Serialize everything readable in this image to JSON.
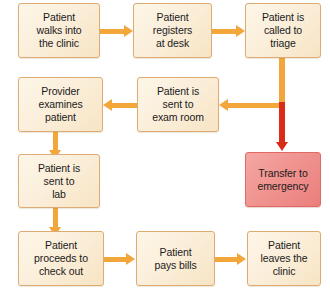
{
  "diagram": {
    "colors": {
      "process_fill": "#fbefdb",
      "process_border": "#ddab73",
      "alert_fill": "#f09490",
      "alert_border": "#e06a63",
      "arrow": "#f3a63a",
      "alert_arrow": "#d92b18",
      "text": "#1b1b1b",
      "background": "#ffffff"
    },
    "nodes": [
      {
        "id": "walks-in",
        "label": "Patient\nwalks into\nthe clinic",
        "line1": "Patient",
        "line2": "walks into",
        "line3": "the clinic",
        "type": "process"
      },
      {
        "id": "registers",
        "label": "Patient\nregisters\nat desk",
        "line1": "Patient",
        "line2": "registers",
        "line3": "at desk",
        "type": "process"
      },
      {
        "id": "triage",
        "label": "Patient is\ncalled to\ntriage",
        "line1": "Patient is",
        "line2": "called to",
        "line3": "triage",
        "type": "process"
      },
      {
        "id": "exam-room",
        "label": "Patient is\nsent to\nexam room",
        "line1": "Patient is",
        "line2": "sent to",
        "line3": "exam room",
        "type": "process"
      },
      {
        "id": "provider",
        "label": "Provider\nexamines\npatient",
        "line1": "Provider",
        "line2": "examines",
        "line3": "patient",
        "type": "process"
      },
      {
        "id": "lab",
        "label": "Patient is\nsent to\nlab",
        "line1": "Patient is",
        "line2": "sent to",
        "line3": "lab",
        "type": "process"
      },
      {
        "id": "check-out",
        "label": "Patient\nproceeds to\ncheck out",
        "line1": "Patient",
        "line2": "proceeds to",
        "line3": "check out",
        "type": "process"
      },
      {
        "id": "pays-bills",
        "label": "Patient\npays bills",
        "line1": "Patient",
        "line2": "pays bills",
        "line3": "",
        "type": "process"
      },
      {
        "id": "leaves",
        "label": "Patient\nleaves the\nclinic",
        "line1": "Patient",
        "line2": "leaves the",
        "line3": "clinic",
        "type": "process"
      },
      {
        "id": "emergency",
        "label": "Transfer to\nemergency",
        "line1": "Transfer to",
        "line2": "emergency",
        "line3": "",
        "type": "alert"
      }
    ],
    "edges": [
      {
        "id": "e1",
        "from": "walks-in",
        "to": "registers",
        "direction": "right"
      },
      {
        "id": "e2",
        "from": "registers",
        "to": "triage",
        "direction": "right"
      },
      {
        "id": "e3",
        "from": "triage",
        "to": "exam-room",
        "direction": "left-elbow"
      },
      {
        "id": "e4",
        "from": "exam-room",
        "to": "provider",
        "direction": "left"
      },
      {
        "id": "e5",
        "from": "provider",
        "to": "lab",
        "direction": "down"
      },
      {
        "id": "e6",
        "from": "lab",
        "to": "check-out",
        "direction": "down"
      },
      {
        "id": "e7",
        "from": "check-out",
        "to": "pays-bills",
        "direction": "right"
      },
      {
        "id": "e8",
        "from": "pays-bills",
        "to": "leaves",
        "direction": "right"
      },
      {
        "id": "e9",
        "from": "triage",
        "to": "emergency",
        "direction": "down",
        "emphasis": "alert"
      }
    ]
  }
}
